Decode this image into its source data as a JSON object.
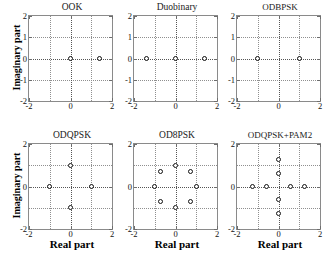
{
  "figure": {
    "axis_labels": {
      "x": "Real part",
      "y": "Imaginary part"
    },
    "xlim": [
      -2,
      2
    ],
    "ylim": [
      -2,
      2
    ],
    "xticks": [
      "-2",
      "0",
      "2"
    ],
    "yticks_top_row": [
      "2",
      "1",
      "0",
      "-1",
      "-2"
    ],
    "yticks_bottom_row": [
      "2",
      "0",
      "-2"
    ],
    "grid": true,
    "marker": "open-circle",
    "marker_color": "#111111",
    "axes_color": "#8a8a8a",
    "grid_color": "#8f8f8f",
    "background": "#ffffff"
  },
  "chart_data": [
    {
      "type": "scatter",
      "title": "OOK",
      "xlabel": "Real part",
      "ylabel": "Imaginary part",
      "xlim": [
        -2,
        2
      ],
      "ylim": [
        -2,
        2
      ],
      "grid": true,
      "legend": "none",
      "points": [
        {
          "x": 0.0,
          "y": 0.0
        },
        {
          "x": 1.4,
          "y": 0.0
        }
      ]
    },
    {
      "type": "scatter",
      "title": "Duobinary",
      "xlabel": "Real part",
      "ylabel": "Imaginary part",
      "xlim": [
        -2,
        2
      ],
      "ylim": [
        -2,
        2
      ],
      "grid": true,
      "legend": "none",
      "points": [
        {
          "x": -1.4,
          "y": 0.0
        },
        {
          "x": 0.0,
          "y": 0.0
        },
        {
          "x": 1.4,
          "y": 0.0
        }
      ]
    },
    {
      "type": "scatter",
      "title": "ODBPSK",
      "xlabel": "Real part",
      "ylabel": "Imaginary part",
      "xlim": [
        -2,
        2
      ],
      "ylim": [
        -2,
        2
      ],
      "grid": true,
      "legend": "none",
      "points": [
        {
          "x": -1.0,
          "y": 0.0
        },
        {
          "x": 1.0,
          "y": 0.0
        }
      ]
    },
    {
      "type": "scatter",
      "title": "ODQPSK",
      "xlabel": "Real part",
      "ylabel": "Imaginary part",
      "xlim": [
        -2,
        2
      ],
      "ylim": [
        -2,
        2
      ],
      "grid": true,
      "legend": "none",
      "points": [
        {
          "x": 0.0,
          "y": 1.0
        },
        {
          "x": -1.0,
          "y": 0.0
        },
        {
          "x": 1.0,
          "y": 0.0
        },
        {
          "x": 0.0,
          "y": -1.0
        }
      ]
    },
    {
      "type": "scatter",
      "title": "OD8PSK",
      "xlabel": "Real part",
      "ylabel": "Imaginary part",
      "xlim": [
        -2,
        2
      ],
      "ylim": [
        -2,
        2
      ],
      "grid": true,
      "legend": "none",
      "points": [
        {
          "x": 1.0,
          "y": 0.0
        },
        {
          "x": 0.71,
          "y": 0.71
        },
        {
          "x": 0.0,
          "y": 1.0
        },
        {
          "x": -0.71,
          "y": 0.71
        },
        {
          "x": -1.0,
          "y": 0.0
        },
        {
          "x": -0.71,
          "y": -0.71
        },
        {
          "x": 0.0,
          "y": -1.0
        },
        {
          "x": 0.71,
          "y": -0.71
        }
      ]
    },
    {
      "type": "scatter",
      "title": "ODQPSK+PAM2",
      "xlabel": "Real part",
      "ylabel": "Imaginary part",
      "xlim": [
        -2,
        2
      ],
      "ylim": [
        -2,
        2
      ],
      "grid": true,
      "legend": "none",
      "points": [
        {
          "x": -1.25,
          "y": 0.0
        },
        {
          "x": -0.6,
          "y": 0.0
        },
        {
          "x": 0.6,
          "y": 0.0
        },
        {
          "x": 1.25,
          "y": 0.0
        },
        {
          "x": 0.0,
          "y": 1.25
        },
        {
          "x": 0.0,
          "y": 0.6
        },
        {
          "x": 0.0,
          "y": -0.6
        },
        {
          "x": 0.0,
          "y": -1.25
        }
      ]
    }
  ]
}
